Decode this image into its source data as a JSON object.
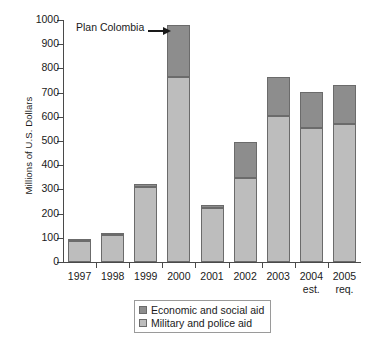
{
  "chart_data": {
    "type": "bar",
    "subtype": "stacked-bar",
    "title": "",
    "xlabel": "",
    "ylabel": "Millions of U.S. Dollars",
    "ylim": [
      0,
      1000
    ],
    "ytick_step": 100,
    "yticks": [
      0,
      100,
      200,
      300,
      400,
      500,
      600,
      700,
      800,
      900,
      1000
    ],
    "ytick_labels": [
      "0",
      "100",
      "200",
      "300",
      "400",
      "500",
      "600",
      "700",
      "800",
      "900",
      "1000"
    ],
    "grid": false,
    "legend_position": "bottom-center",
    "categories": [
      "1997",
      "1998",
      "1999",
      "2000",
      "2001",
      "2002",
      "2003",
      "2004",
      "2005"
    ],
    "category_sublabels": [
      "",
      "",
      "",
      "",
      "",
      "",
      "",
      "est.",
      "req."
    ],
    "series": [
      {
        "name": "Military and police aid",
        "color": "#bdbdbd",
        "values": [
          88,
          110,
          308,
          765,
          225,
          348,
          605,
          555,
          572
        ]
      },
      {
        "name": "Economic and social aid",
        "color": "#8d8d8d",
        "values": [
          2,
          2,
          16,
          215,
          10,
          147,
          160,
          148,
          158
        ]
      }
    ],
    "totals": [
      90,
      112,
      324,
      980,
      235,
      495,
      765,
      703,
      730
    ],
    "annotations": [
      {
        "text": "Plan Colombia",
        "target_category": "2000",
        "arrow": "right"
      }
    ]
  },
  "legend": {
    "items": [
      {
        "label": "Economic and social aid",
        "color": "#8d8d8d"
      },
      {
        "label": "Military and police aid",
        "color": "#bdbdbd"
      }
    ]
  }
}
